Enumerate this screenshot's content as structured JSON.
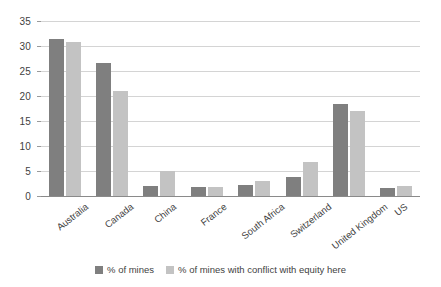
{
  "chart_data": {
    "type": "bar",
    "title": "",
    "subtitle": "",
    "xlabel": "",
    "ylabel": "",
    "ylim": [
      0,
      35
    ],
    "y_ticks": [
      0,
      5,
      10,
      15,
      20,
      25,
      30,
      35
    ],
    "grid": true,
    "legend_position": "bottom",
    "categories": [
      "Australia",
      "Canada",
      "China",
      "France",
      "South Africa",
      "Switzerland",
      "United Kingdom",
      "US"
    ],
    "series": [
      {
        "name": "% of mines",
        "color": "#7f7f7f",
        "values": [
          31.5,
          26.6,
          2.0,
          1.9,
          2.2,
          3.8,
          18.4,
          1.7
        ]
      },
      {
        "name": "% of mines with conflict with equity here",
        "color": "#c3c3c3",
        "values": [
          30.8,
          21.0,
          5.0,
          1.8,
          3.1,
          6.9,
          17.0,
          2.1
        ]
      }
    ]
  },
  "axis": {
    "y_tick_labels": [
      "35",
      "30",
      "25",
      "20",
      "15",
      "10",
      "5",
      "0"
    ]
  },
  "legend": {
    "items": [
      {
        "label": "% of mines"
      },
      {
        "label": "% of mines with conflict with equity here"
      }
    ]
  }
}
